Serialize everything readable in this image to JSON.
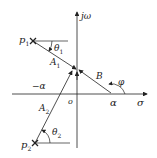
{
  "diagram": {
    "axes": {
      "imag_label": "jω",
      "real_label": "σ",
      "origin_label": "o"
    },
    "points": {
      "p1": {
        "label": "p",
        "sub": "1"
      },
      "p2": {
        "label": "p",
        "sub": "2"
      },
      "zero": {
        "label": "α"
      },
      "neg_alpha": {
        "label": "−α"
      }
    },
    "vectors": {
      "A1": {
        "label": "A",
        "sub": "1"
      },
      "A2": {
        "label": "A",
        "sub": "2"
      },
      "B": {
        "label": "B"
      }
    },
    "angles": {
      "theta1": {
        "label": "θ",
        "sub": "1"
      },
      "theta2": {
        "label": "θ",
        "sub": "2"
      },
      "phi": {
        "label": "φ"
      }
    },
    "colors": {
      "line": "#222222",
      "background": "#ffffff"
    }
  }
}
